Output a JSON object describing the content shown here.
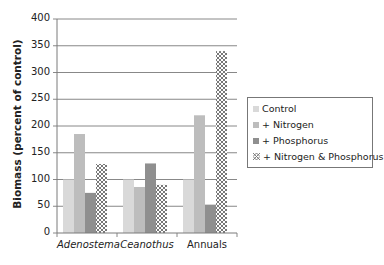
{
  "chart_data": {
    "type": "bar",
    "title": "",
    "xlabel": "",
    "ylabel": "Biomass (percent of control)",
    "ylim": [
      0,
      400
    ],
    "yticks": [
      0,
      50,
      100,
      150,
      200,
      250,
      300,
      350,
      400
    ],
    "grid": true,
    "legend_position": "right",
    "categories": [
      "Adenostema",
      "Ceanothus",
      "Annuals"
    ],
    "categories_italic": [
      true,
      true,
      false
    ],
    "series": [
      {
        "name": "Control",
        "color": "#d9d9d9",
        "pattern": "solid",
        "values": [
          100,
          100,
          100
        ]
      },
      {
        "name": "+ Nitrogen",
        "color": "#bdbdbd",
        "pattern": "solid",
        "values": [
          185,
          86,
          220
        ]
      },
      {
        "name": "+ Phosphorus",
        "color": "#8f8f8f",
        "pattern": "solid",
        "values": [
          75,
          130,
          53
        ]
      },
      {
        "name": "+ Nitrogen & Phosphorus",
        "color": "#ffffff",
        "pattern": "crosshatch",
        "values": [
          129,
          90,
          340
        ]
      }
    ]
  },
  "legend": {
    "items": [
      "Control",
      "+ Nitrogen",
      "+ Phosphorus",
      "+ Nitrogen & Phosphorus"
    ]
  },
  "axis": {
    "ylabel": "Biomass (percent of control)",
    "yticks": [
      "0",
      "50",
      "100",
      "150",
      "200",
      "250",
      "300",
      "350",
      "400"
    ],
    "xticks": [
      "Adenostema",
      "Ceanothus",
      "Annuals"
    ]
  }
}
